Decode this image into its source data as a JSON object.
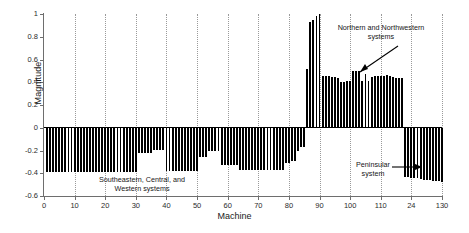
{
  "chart_data": {
    "type": "bar",
    "title": "",
    "subtitle": "",
    "xlabel": "Machine",
    "ylabel": "Magnitude",
    "xlim": [
      0,
      130
    ],
    "ylim": [
      -0.6,
      1.0
    ],
    "grid": "vertical-dotted",
    "legend": "none",
    "xticks": [
      0,
      10,
      20,
      30,
      40,
      50,
      60,
      70,
      80,
      90,
      100,
      110,
      120,
      130
    ],
    "xtick_labels": [
      "0",
      "10",
      "20",
      "30",
      "40",
      "50",
      "60",
      "70",
      "80",
      "90",
      "100",
      "110",
      "24",
      "130"
    ],
    "yticks": [
      1,
      0.8,
      0.6,
      0.4,
      0.2,
      0,
      -0.2,
      -0.4,
      -0.6
    ],
    "ytick_labels": [
      "1",
      "0.8",
      "0.6",
      "0.4",
      "0.2",
      "0",
      "-0.2",
      "-0.4",
      "-0.6"
    ],
    "bar_color": "#000000",
    "annotations": [
      {
        "id": "southeastern",
        "text": "Southeastern, Central, and\nWestern systems",
        "arrow": false
      },
      {
        "id": "northern",
        "text": "Northern and Northwestern\nsystems",
        "arrow": true,
        "arrow_direction": "down-left"
      },
      {
        "id": "peninsular",
        "text": "Peninsular\nsystem",
        "arrow": true,
        "arrow_direction": "right"
      }
    ],
    "x": [
      1,
      2,
      3,
      4,
      5,
      6,
      7,
      8,
      9,
      10,
      11,
      12,
      13,
      14,
      15,
      16,
      17,
      18,
      19,
      20,
      21,
      22,
      23,
      24,
      25,
      26,
      27,
      28,
      29,
      30,
      31,
      32,
      33,
      34,
      35,
      36,
      37,
      38,
      39,
      40,
      41,
      42,
      43,
      44,
      45,
      46,
      47,
      48,
      49,
      50,
      51,
      52,
      53,
      54,
      55,
      56,
      57,
      58,
      59,
      60,
      61,
      62,
      63,
      64,
      65,
      66,
      67,
      68,
      69,
      70,
      71,
      72,
      73,
      74,
      75,
      76,
      77,
      78,
      79,
      80,
      81,
      82,
      83,
      84,
      85,
      86,
      87,
      88,
      89,
      90,
      91,
      92,
      93,
      94,
      95,
      96,
      97,
      98,
      99,
      100,
      101,
      102,
      103,
      104,
      105,
      106,
      107,
      108,
      109,
      110,
      111,
      112,
      113,
      114,
      115,
      116,
      117,
      118,
      119,
      120,
      121,
      122,
      123,
      124,
      125,
      126,
      127,
      128,
      129,
      130
    ],
    "values": [
      -0.385,
      -0.385,
      -0.385,
      -0.385,
      -0.385,
      -0.385,
      -0.385,
      -0.385,
      -0.385,
      -0.385,
      -0.385,
      -0.385,
      -0.385,
      -0.385,
      -0.385,
      -0.385,
      -0.385,
      -0.385,
      -0.385,
      -0.385,
      -0.385,
      -0.385,
      -0.385,
      -0.385,
      -0.385,
      -0.385,
      -0.385,
      -0.385,
      -0.385,
      -0.385,
      -0.22,
      -0.22,
      -0.22,
      -0.22,
      -0.22,
      -0.195,
      -0.195,
      -0.195,
      -0.195,
      -0.38,
      -0.38,
      -0.38,
      -0.38,
      -0.38,
      -0.38,
      -0.38,
      -0.38,
      -0.38,
      -0.38,
      -0.38,
      -0.26,
      -0.26,
      -0.26,
      -0.205,
      -0.205,
      -0.205,
      -0.205,
      -0.33,
      -0.33,
      -0.33,
      -0.33,
      -0.33,
      -0.33,
      -0.37,
      -0.37,
      -0.37,
      -0.37,
      -0.37,
      -0.37,
      -0.37,
      -0.37,
      -0.37,
      -0.37,
      -0.37,
      -0.37,
      -0.37,
      -0.37,
      -0.37,
      -0.31,
      -0.31,
      -0.29,
      -0.29,
      -0.2,
      -0.165,
      -0.165,
      0.52,
      0.93,
      0.95,
      0.985,
      1.0,
      0.455,
      0.455,
      0.455,
      0.45,
      0.445,
      0.44,
      0.4,
      0.405,
      0.41,
      0.41,
      0.5,
      0.5,
      0.5,
      0.415,
      0.47,
      0.415,
      0.45,
      0.455,
      0.455,
      0.455,
      0.455,
      0.46,
      0.455,
      0.445,
      0.44,
      0.44,
      0.44,
      -0.435,
      -0.435,
      -0.44,
      -0.44,
      -0.445,
      -0.45,
      -0.455,
      -0.455,
      -0.46,
      -0.465,
      -0.47,
      -0.47,
      -0.475
    ],
    "segments": [
      {
        "label": "Southeastern, Central, and Western systems",
        "x_start": 1,
        "x_end": 85,
        "sign": "negative"
      },
      {
        "label": "Northern and Northwestern systems",
        "x_start": 86,
        "x_end": 117,
        "sign": "positive"
      },
      {
        "label": "Peninsular system",
        "x_start": 118,
        "x_end": 130,
        "sign": "negative"
      }
    ]
  }
}
